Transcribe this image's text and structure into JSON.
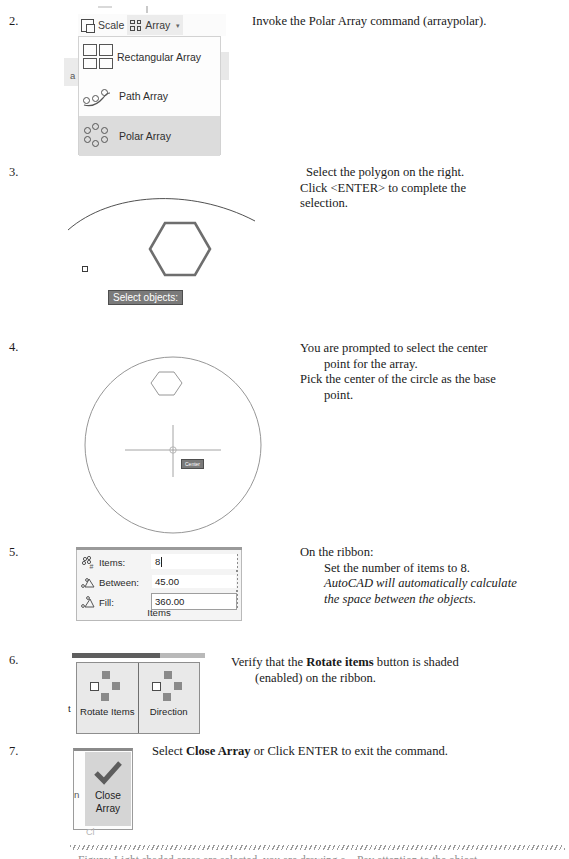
{
  "document": {
    "title": "AutoCAD Polar Array tutorial steps"
  },
  "steps": [
    {
      "number": "2.",
      "description_html": "Invoke the Polar Array command (arraypolar)."
    },
    {
      "number": "3.",
      "line1": "Select the polygon on the right.",
      "line2": "Click <ENTER> to complete the",
      "line3": "selection."
    },
    {
      "number": "4.",
      "line1": "You are prompted to select the center",
      "line2": "point for the array.",
      "line3": "Pick the center of the circle as the base",
      "line4": "point."
    },
    {
      "number": "5.",
      "line1": "On the ribbon:",
      "line2": "Set the number of items to 8.",
      "line3": "AutoCAD will automatically calculate",
      "line4": "the space between the objects."
    },
    {
      "number": "6.",
      "line1": "Verify that the Rotate items button is shaded",
      "line2": "(enabled) on the ribbon."
    },
    {
      "number": "7.",
      "line1": "Select Close Array or Click ENTER to exit the command."
    }
  ],
  "ribbon": {
    "scale_label": "Scale",
    "array_label": "Array",
    "dropdown_caret": "▾",
    "partial_left_text": "a",
    "menu_items": [
      {
        "label": "Rectangular Array",
        "icon": "rectangular-array-icon",
        "selected": false
      },
      {
        "label": "Path Array",
        "icon": "path-array-icon",
        "selected": false
      },
      {
        "label": "Polar Array",
        "icon": "polar-array-icon",
        "selected": true
      }
    ]
  },
  "step3_canvas": {
    "tooltip": "Select objects:",
    "shapes": [
      "arc",
      "hexagon",
      "pickbox"
    ]
  },
  "step4_canvas": {
    "tooltip": "Center",
    "shapes": [
      "circle",
      "hexagon",
      "crosshair",
      "osnap-center-marker"
    ]
  },
  "items_panel": {
    "rows": [
      {
        "icon": "items-count-icon",
        "label": "Items:",
        "value": "8",
        "focused": true
      },
      {
        "icon": "angle-between-icon",
        "label": "Between:",
        "value": "45.00",
        "focused": false
      },
      {
        "icon": "fill-angle-icon",
        "label": "Fill:",
        "value": "360.00",
        "focused": false
      }
    ],
    "panel_title": "Items"
  },
  "properties_panel": {
    "left_partial_label": "t",
    "buttons": [
      {
        "label": "Rotate Items",
        "icon": "rotate-items-icon",
        "enabled": true
      },
      {
        "label": "Direction",
        "icon": "direction-icon",
        "enabled": true
      }
    ]
  },
  "close_panel": {
    "left_partial_label": "n",
    "button_line1": "Close",
    "button_line2": "Array",
    "icon": "checkmark-icon",
    "ghost_text": "Cl"
  },
  "footer": {
    "text": "Figure: Light shaded areas are selected, you are drawing a... Pay attention to the object"
  },
  "colors": {
    "selected_menu_bg": "#dcdcdc",
    "tooltip_bg": "#7a7a7a",
    "panel_bg": "#f4f4f4",
    "button_bg": "#e9e9e9",
    "close_button_bg": "#d5d5d5",
    "icon_stroke": "#555555"
  }
}
